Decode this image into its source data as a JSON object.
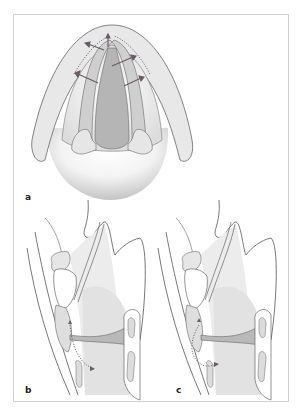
{
  "figure": {
    "panels": [
      {
        "id": "a",
        "label": "a",
        "view": "superior view of larynx"
      },
      {
        "id": "b",
        "label": "b",
        "view": "sagittal section of larynx"
      },
      {
        "id": "c",
        "label": "c",
        "view": "sagittal section of larynx"
      }
    ],
    "colors": {
      "outline": "#555555",
      "fill_light": "#e6e6e6",
      "fill_mid": "#cfcfcf",
      "fill_dark": "#b5b5b5",
      "arrow": "#6a5a66",
      "frame": "#cfcfcf"
    }
  }
}
